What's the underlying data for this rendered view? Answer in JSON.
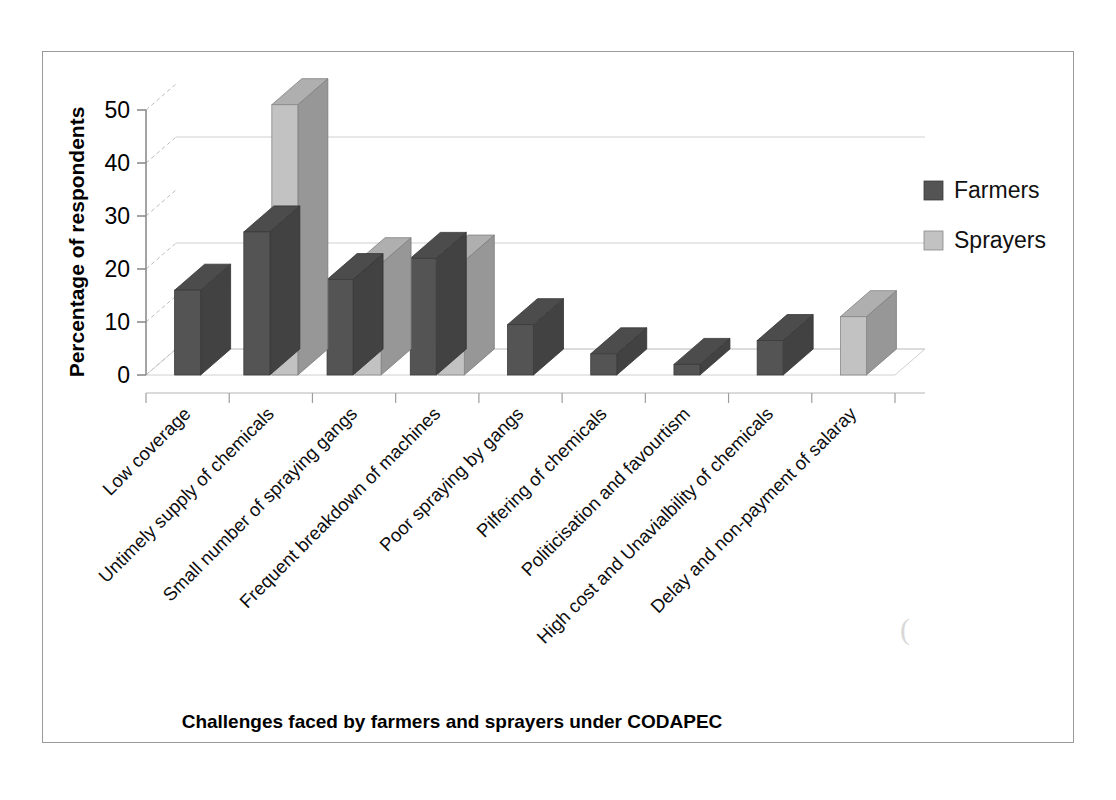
{
  "chart_data": {
    "type": "bar",
    "title": "",
    "xlabel": "Challenges faced by farmers and sprayers under CODAPEC",
    "ylabel": "Percentage of respondents",
    "categories": [
      "Low coverage",
      "Untimely supply of chemicals",
      "Small number of spraying gangs",
      "Frequent breakdown of machines",
      "Poor spraying by gangs",
      "Pilfering of chemicals",
      "Politicisation and favourtism",
      "High cost and Unavialbility of chemicals",
      "Delay and non-payment of salaray"
    ],
    "series": [
      {
        "name": "Farmers",
        "color": "#545454",
        "values": [
          16,
          27,
          18,
          22,
          9.5,
          4,
          2,
          6.5,
          0
        ]
      },
      {
        "name": "Sprayers",
        "color": "#c2c2c2",
        "values": [
          0,
          51,
          21,
          21.5,
          0,
          0,
          0,
          0,
          11
        ]
      }
    ],
    "ylim": [
      0,
      50
    ],
    "yticks": [
      0,
      10,
      20,
      30,
      40,
      50
    ],
    "ytick_labels": [
      "0",
      "10",
      "20",
      "30",
      "40",
      "50"
    ],
    "grid": true,
    "gridlines_at": [
      0,
      20,
      40
    ],
    "legend_position": "right",
    "style": "3d-clustered-column"
  },
  "legend": {
    "items": [
      {
        "label": "Farmers",
        "swatch": "#545454"
      },
      {
        "label": "Sprayers",
        "swatch": "#c2c2c2"
      }
    ]
  },
  "colors": {
    "farmers": "#545454",
    "sprayers": "#c2c2c2",
    "frame_border": "#9a9a9a",
    "axis_line": "#8c8c8c",
    "grid_line": "#d0d0d0",
    "text": "#000000",
    "background": "#ffffff"
  },
  "artifact": {
    "scan_mark": "("
  }
}
